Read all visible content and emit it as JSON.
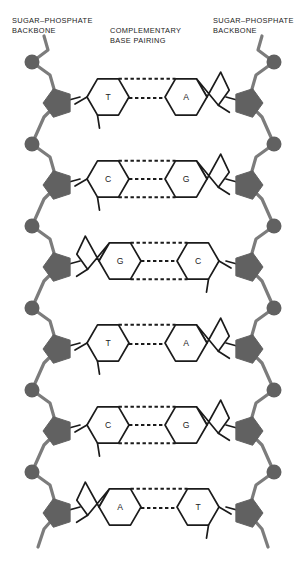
{
  "figure": {
    "labels": {
      "backbone_left": "SUGAR–PHOSPHATE\nBACKBONE",
      "pairing": "COMPLEMENTARY\nBASE PAIRING",
      "backbone_right": "SUGAR–PHOSPHATE\nBACKBONE"
    }
  },
  "colors": {
    "backbone_gray": "#7c7c7c",
    "sugar_fill": "#616161",
    "phosphate_fill": "#616161",
    "base_outline": "#1b1b1b",
    "base_fill": "#ffffff",
    "hbond": "#1b1b1b",
    "text": "#1b1b1b",
    "background": "#ffffff"
  },
  "geometry": {
    "width": 307,
    "height": 565,
    "row_pitch": 82,
    "first_phosphate_y": 62,
    "first_sugar_y": 103,
    "left_phosphate_x": 32,
    "left_sugar_x": 58,
    "right_phosphate_x": 274,
    "right_sugar_x": 248,
    "hex_radius": 21,
    "phosphate_radius": 7.5,
    "sugar_radius": 15
  },
  "base_pairs": [
    {
      "index": 1,
      "row_y": 97,
      "left": {
        "letter": "T",
        "type": "pyrimidine"
      },
      "right": {
        "letter": "A",
        "type": "purine"
      },
      "hydrogen_bonds": 2,
      "pair_name": "T–A"
    },
    {
      "index": 2,
      "row_y": 179,
      "left": {
        "letter": "C",
        "type": "pyrimidine"
      },
      "right": {
        "letter": "G",
        "type": "purine"
      },
      "hydrogen_bonds": 3,
      "pair_name": "C–G"
    },
    {
      "index": 3,
      "row_y": 261,
      "left": {
        "letter": "G",
        "type": "purine"
      },
      "right": {
        "letter": "C",
        "type": "pyrimidine"
      },
      "hydrogen_bonds": 3,
      "pair_name": "G–C"
    },
    {
      "index": 4,
      "row_y": 343,
      "left": {
        "letter": "T",
        "type": "pyrimidine"
      },
      "right": {
        "letter": "A",
        "type": "purine"
      },
      "hydrogen_bonds": 2,
      "pair_name": "T–A"
    },
    {
      "index": 5,
      "row_y": 425,
      "left": {
        "letter": "C",
        "type": "pyrimidine"
      },
      "right": {
        "letter": "G",
        "type": "purine"
      },
      "hydrogen_bonds": 3,
      "pair_name": "C–G"
    },
    {
      "index": 6,
      "row_y": 507,
      "left": {
        "letter": "A",
        "type": "purine"
      },
      "right": {
        "letter": "T",
        "type": "pyrimidine"
      },
      "hydrogen_bonds": 2,
      "pair_name": "A–T"
    }
  ],
  "base_letters": {
    "r1": {
      "left": "T",
      "right": "A"
    },
    "r2": {
      "left": "C",
      "right": "G"
    },
    "r3": {
      "left": "G",
      "right": "C"
    },
    "r4": {
      "left": "T",
      "right": "A"
    },
    "r5": {
      "left": "C",
      "right": "G"
    },
    "r6": {
      "left": "A",
      "right": "T"
    }
  }
}
